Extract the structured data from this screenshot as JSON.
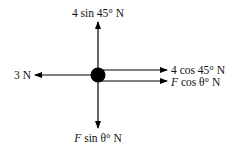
{
  "diagram": {
    "type": "free-body-diagram",
    "object": {
      "shape": "circle",
      "color": "#000000"
    },
    "forces": [
      {
        "id": "up",
        "direction": "up",
        "label_prefix": "",
        "label_text": "4 sin 45° N"
      },
      {
        "id": "left",
        "direction": "left",
        "label_prefix": "",
        "label_text": "3 N"
      },
      {
        "id": "right-upper",
        "direction": "right",
        "label_prefix": "",
        "label_text": "4 cos 45° N"
      },
      {
        "id": "right-lower",
        "direction": "right",
        "label_prefix": "F",
        "label_text": " cos θ° N"
      },
      {
        "id": "down",
        "direction": "down",
        "label_prefix": "F",
        "label_text": " sin θ° N"
      }
    ]
  }
}
